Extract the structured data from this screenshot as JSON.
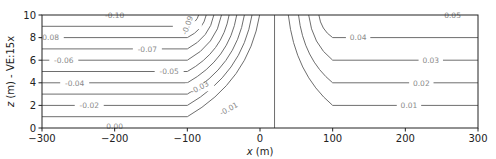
{
  "chart_data": {
    "type": "contour",
    "title": "",
    "xlabel": "x (m)",
    "ylabel": "z (m) - VE:15x",
    "xlim": [
      -300,
      300
    ],
    "ylim": [
      0,
      10
    ],
    "xticks": [
      "−300",
      "−200",
      "−100",
      "0",
      "100",
      "200",
      "300"
    ],
    "xtick_values": [
      -300,
      -200,
      -100,
      0,
      100,
      200,
      300
    ],
    "yticks": [
      "0",
      "2",
      "4",
      "6",
      "8",
      "10"
    ],
    "ytick_values": [
      0,
      2,
      4,
      6,
      8,
      10
    ],
    "grid": false,
    "color": "#6e6e6e",
    "vertical_line_x": 20,
    "left_levels": [
      {
        "value": -0.1,
        "label": "-0.10",
        "z": 10.0,
        "label_x": -200
      },
      {
        "value": -0.09,
        "label": "-0.09",
        "z": 9.0,
        "label_x": -100
      },
      {
        "value": -0.08,
        "label": "-0.08",
        "z": 8.0,
        "label_x": -290
      },
      {
        "value": -0.07,
        "label": "-0.07",
        "z": 7.0,
        "label_x": -155
      },
      {
        "value": -0.06,
        "label": "-0.06",
        "z": 6.0,
        "label_x": -270
      },
      {
        "value": -0.05,
        "label": "-0.05",
        "z": 5.0,
        "label_x": -125
      },
      {
        "value": -0.04,
        "label": "-0.04",
        "z": 4.0,
        "label_x": -255
      },
      {
        "value": -0.03,
        "label": "-0.03",
        "z": 3.0,
        "label_x": -83
      },
      {
        "value": -0.02,
        "label": "-0.02",
        "z": 2.0,
        "label_x": -235
      },
      {
        "value": -0.01,
        "label": "-0.01",
        "z": 1.0,
        "label_x": -43
      },
      {
        "value": 0.0,
        "label": "0.00",
        "z": 0.0,
        "label_x": -200
      }
    ],
    "right_levels": [
      {
        "value": 0.05,
        "label": "0.05",
        "z": 10.0,
        "label_x": 265
      },
      {
        "value": 0.04,
        "label": "0.04",
        "z": 8.0,
        "label_x": 135
      },
      {
        "value": 0.03,
        "label": "0.03",
        "z": 6.0,
        "label_x": 235
      },
      {
        "value": 0.02,
        "label": "0.02",
        "z": 4.0,
        "label_x": 222
      },
      {
        "value": 0.01,
        "label": "0.01",
        "z": 2.0,
        "label_x": 205
      }
    ]
  }
}
